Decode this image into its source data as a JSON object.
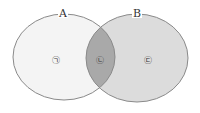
{
  "diagram": {
    "type": "venn",
    "sets": [
      {
        "id": "A",
        "label": "A",
        "cx": 64,
        "cy": 57,
        "rx": 51,
        "ry": 43,
        "fill": "#f4f4f4"
      },
      {
        "id": "B",
        "label": "B",
        "cx": 137,
        "cy": 58,
        "rx": 51,
        "ry": 44,
        "fill": "#dcdcdc"
      }
    ],
    "intersection_fill": "#a9a9a9",
    "stroke": "#8a8a8a",
    "regions": [
      {
        "id": "a_only",
        "label": "㉠",
        "x": 56,
        "y": 60
      },
      {
        "id": "a_and_b",
        "label": "㉡",
        "x": 100,
        "y": 60
      },
      {
        "id": "b_only",
        "label": "㉢",
        "x": 148,
        "y": 60
      }
    ]
  }
}
